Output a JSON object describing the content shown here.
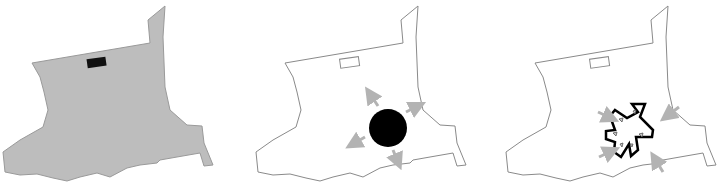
{
  "diagram": {
    "panels": [
      {
        "id": "panel-1",
        "description": "site filled gray with dark building block",
        "offset_x": 0,
        "fill": "#bdbdbd",
        "stroke": "#9a9a9a",
        "marker_fill": "#111111"
      },
      {
        "id": "panel-2",
        "description": "site outline with black circle and outward arrows",
        "offset_x": 250,
        "fill": "#ffffff",
        "stroke": "#8a8a8a",
        "circle_fill": "#000000",
        "arrow_color": "#b3b3b3",
        "arrow_direction": "outward"
      },
      {
        "id": "panel-3",
        "description": "site outline with star-shaped building and inward arrows",
        "offset_x": 500,
        "fill": "#ffffff",
        "stroke": "#8a8a8a",
        "star_stroke": "#000000",
        "arrow_color": "#b3b3b3",
        "arrow_direction": "inward"
      }
    ],
    "colors": {
      "site_gray": "#bdbdbd",
      "outline": "#8a8a8a",
      "black": "#000000",
      "arrow_gray": "#b3b3b3"
    }
  }
}
